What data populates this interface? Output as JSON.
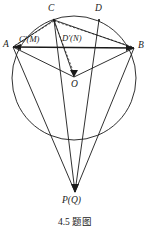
{
  "figure": {
    "caption": "4.5 题图",
    "stroke_color": "#1a1a1a",
    "background_color": "#ffffff",
    "labels": {
      "A": "A",
      "B": "B",
      "C": "C",
      "D": "D",
      "O": "O",
      "C_prime_M": "C'(M)",
      "D_prime_N": "D'(N)",
      "P_Q": "P(Q)"
    },
    "points": {
      "A": {
        "x": 13,
        "y": 47
      },
      "B": {
        "x": 134,
        "y": 48
      },
      "C": {
        "x": 54,
        "y": 20
      },
      "D": {
        "x": 99,
        "y": 20
      },
      "O": {
        "x": 74,
        "y": 77
      },
      "C_prime": {
        "x": 58,
        "y": 47
      },
      "D_prime": {
        "x": 89,
        "y": 47
      },
      "P": {
        "x": 75,
        "y": 192
      }
    },
    "circle": {
      "cx": 74,
      "cy": 78,
      "r": 62
    },
    "segments": [
      {
        "name": "chord-AB",
        "from": "A",
        "to": "B",
        "style": "solid"
      },
      {
        "name": "segment-AC",
        "from": "A",
        "to": "C",
        "style": "solid"
      },
      {
        "name": "segment-AO",
        "from": "A",
        "to": "O",
        "style": "solid"
      },
      {
        "name": "segment-OB",
        "from": "O",
        "to": "B",
        "style": "solid"
      },
      {
        "name": "segment-CO",
        "from": "C",
        "to": "O",
        "style": "solid"
      },
      {
        "name": "segment-CB",
        "from": "C",
        "to": "B",
        "style": "solid"
      },
      {
        "name": "segment-CB-dashed",
        "from": "C",
        "to": "B",
        "style": "dashed"
      },
      {
        "name": "segment-CA-dashed",
        "from": "C",
        "to": "A",
        "style": "dashed"
      },
      {
        "name": "segment-CDprime",
        "from": "C",
        "to": "D_prime",
        "style": "solid"
      },
      {
        "name": "line-A-to-P",
        "from": "A",
        "to": "P",
        "style": "solid"
      },
      {
        "name": "line-B-to-P",
        "from": "B",
        "to": "P",
        "style": "solid"
      },
      {
        "name": "line-C-to-P",
        "from": "C",
        "to": "P",
        "style": "solid"
      },
      {
        "name": "line-D-to-P",
        "from": "D",
        "to": "P",
        "style": "solid"
      }
    ]
  }
}
